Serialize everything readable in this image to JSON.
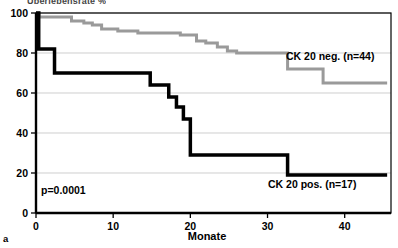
{
  "figure": {
    "panel_letter": "a",
    "cropped_top_text": "Überlebensrate %",
    "annotation_pvalue": "p=0.0001"
  },
  "chart_data": {
    "type": "line",
    "title": "",
    "subtitle": "",
    "xlabel": "Monate",
    "ylabel": "",
    "xlim": [
      0,
      46
    ],
    "ylim": [
      0,
      100
    ],
    "xticks": [
      0,
      10,
      20,
      30,
      40
    ],
    "xtick_labels": [
      "0",
      "10",
      "20",
      "30",
      "40"
    ],
    "yticks": [
      0,
      20,
      40,
      60,
      80,
      100
    ],
    "ytick_labels": [
      "0",
      "20",
      "40",
      "60",
      "80",
      "100"
    ],
    "grid": "horizontal",
    "grid_color": "#b9b9b9",
    "legend_position": "inline-right",
    "annotations": [
      {
        "text": "p=0.0001",
        "x": 1.5,
        "y": 9
      },
      {
        "text": "CK 20 neg. (n=44)",
        "x": 31.5,
        "y": 72
      },
      {
        "text": "CK 20 pos. (n=17)",
        "x": 29.5,
        "y": 13
      }
    ],
    "series": [
      {
        "name": "CK 20 neg. (n=44)",
        "label": "CK 20 neg. (n=44)",
        "color": "#9a9a9a",
        "style": "step",
        "linewidth": 3,
        "n": 44,
        "x": [
          0,
          0.4,
          4.5,
          5.2,
          6.5,
          7.3,
          8.4,
          9.4,
          10.4,
          11.6,
          13.0,
          14.0,
          18.5,
          20.5,
          21.5,
          22.5,
          23.5,
          24.6,
          25.6,
          26.6,
          32.5,
          33.5,
          37.0,
          45.5
        ],
        "y": [
          100,
          98,
          98,
          96,
          96,
          94,
          94,
          92,
          92,
          90,
          90,
          89,
          89,
          87,
          86,
          85,
          84,
          82,
          80,
          80,
          80,
          72,
          72,
          65
        ],
        "step_points": [
          {
            "x": 0,
            "y": 100
          },
          {
            "x": 0.4,
            "y": 98
          },
          {
            "x": 4.6,
            "y": 96
          },
          {
            "x": 6.2,
            "y": 95
          },
          {
            "x": 7.3,
            "y": 94
          },
          {
            "x": 8.5,
            "y": 92
          },
          {
            "x": 10.6,
            "y": 91
          },
          {
            "x": 13.2,
            "y": 90
          },
          {
            "x": 18.7,
            "y": 89
          },
          {
            "x": 20.8,
            "y": 86
          },
          {
            "x": 22.0,
            "y": 85
          },
          {
            "x": 23.5,
            "y": 83
          },
          {
            "x": 24.8,
            "y": 81
          },
          {
            "x": 26.0,
            "y": 80
          },
          {
            "x": 32.6,
            "y": 72
          },
          {
            "x": 37.2,
            "y": 65
          },
          {
            "x": 45.5,
            "y": 65
          }
        ]
      },
      {
        "name": "CK 20 pos. (n=17)",
        "label": "CK 20 pos. (n=17)",
        "color": "#000000",
        "style": "step",
        "linewidth": 3.5,
        "n": 17,
        "x": [
          0,
          0.3,
          2.3,
          10.2,
          14.6,
          17.3,
          18.3,
          19.2,
          20.0,
          32.6,
          45.5
        ],
        "y": [
          100,
          82,
          70,
          70,
          64,
          58,
          53,
          47,
          29,
          29,
          19
        ],
        "step_points": [
          {
            "x": 0,
            "y": 100
          },
          {
            "x": 0.35,
            "y": 82
          },
          {
            "x": 2.4,
            "y": 70
          },
          {
            "x": 14.8,
            "y": 64
          },
          {
            "x": 17.2,
            "y": 58
          },
          {
            "x": 18.2,
            "y": 53
          },
          {
            "x": 19.1,
            "y": 47
          },
          {
            "x": 20.0,
            "y": 29
          },
          {
            "x": 32.6,
            "y": 19
          },
          {
            "x": 45.5,
            "y": 19
          }
        ]
      }
    ]
  }
}
